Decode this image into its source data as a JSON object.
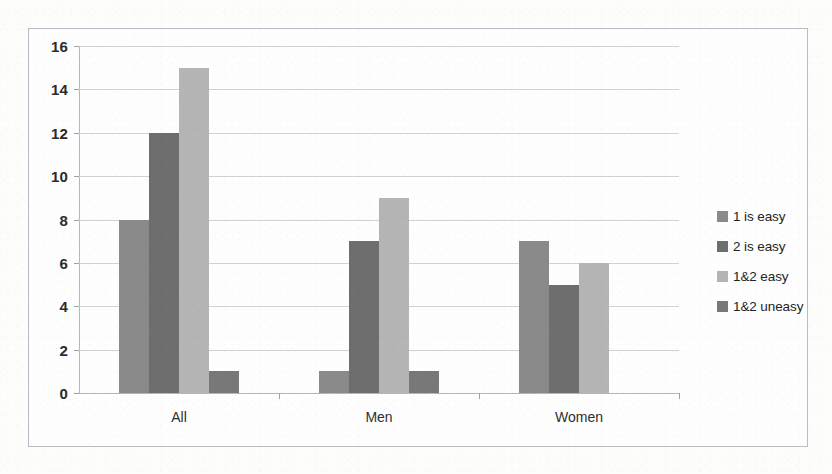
{
  "chart_data": {
    "type": "bar",
    "title": "",
    "subtitle": "",
    "xlabel": "",
    "ylabel": "",
    "categories": [
      "All",
      "Men",
      "Women"
    ],
    "series": [
      {
        "name": "1 is easy",
        "values": [
          8,
          12,
          15
        ],
        "color": "#8a8a8a"
      },
      {
        "name": "2 is easy",
        "values": [
          12,
          7,
          5
        ],
        "color": "#6e6e6e"
      },
      {
        "name": "1&2 easy",
        "values": [
          15,
          9,
          6
        ],
        "color": "#b5b5b5"
      },
      {
        "name": "1&2 uneasy",
        "values": [
          1,
          1,
          0
        ],
        "color": "#787878"
      }
    ],
    "group_values": {
      "All": [
        8,
        12,
        15,
        1
      ],
      "Men": [
        1,
        7,
        9,
        1
      ],
      "Women": [
        7,
        5,
        6,
        0
      ]
    },
    "ylim": [
      0,
      16
    ],
    "ytick_step": 2,
    "yticks": [
      16,
      14,
      12,
      10,
      8,
      6,
      4,
      2,
      0
    ],
    "grid": true,
    "legend_position": "right",
    "legend_entries": [
      {
        "label": "1 is easy",
        "color": "#8a8a8a"
      },
      {
        "label": "2 is easy",
        "color": "#6e6e6e"
      },
      {
        "label": "1&2 easy",
        "color": "#b5b5b5"
      },
      {
        "label": "1&2 uneasy",
        "color": "#787878"
      }
    ],
    "annotations": []
  },
  "colors": {
    "series_1": "#8a8a8a",
    "series_2": "#6e6e6e",
    "series_3": "#b5b5b5",
    "series_4": "#787878",
    "grid": "#cfd2d6",
    "axis": "#b4b7bb",
    "frame": "#b9bcc0",
    "text": "#2b2b2b",
    "background": "#fefefe"
  }
}
